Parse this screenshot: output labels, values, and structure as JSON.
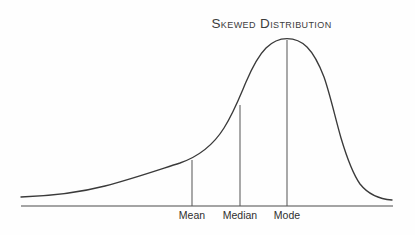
{
  "chart_data": {
    "type": "line",
    "title": "Skewed Distribution",
    "subtitle": "",
    "xlabel": "",
    "ylabel": "",
    "grid": false,
    "legend": false,
    "skew": "right-skewed (positive skew)",
    "annotations": [
      {
        "label": "Mean",
        "x_px": 192,
        "curve_top_px": 160,
        "order": 1
      },
      {
        "label": "Median",
        "x_px": 240,
        "curve_top_px": 105,
        "order": 2
      },
      {
        "label": "Mode",
        "x_px": 287,
        "curve_top_px": 40,
        "order": 3
      }
    ],
    "axis": {
      "baseline_y_px": 206,
      "x_start_px": 21,
      "x_end_px": 393,
      "ticks": [
        "Mean",
        "Median",
        "Mode"
      ]
    },
    "curve_points": [
      {
        "x": 21,
        "y": 197
      },
      {
        "x": 60,
        "y": 195
      },
      {
        "x": 95,
        "y": 189
      },
      {
        "x": 130,
        "y": 180
      },
      {
        "x": 160,
        "y": 170
      },
      {
        "x": 192,
        "y": 160
      },
      {
        "x": 215,
        "y": 140
      },
      {
        "x": 232,
        "y": 118
      },
      {
        "x": 240,
        "y": 105
      },
      {
        "x": 250,
        "y": 82
      },
      {
        "x": 258,
        "y": 62
      },
      {
        "x": 266,
        "y": 49
      },
      {
        "x": 276,
        "y": 41
      },
      {
        "x": 287,
        "y": 39
      },
      {
        "x": 300,
        "y": 41
      },
      {
        "x": 310,
        "y": 48
      },
      {
        "x": 320,
        "y": 62
      },
      {
        "x": 330,
        "y": 88
      },
      {
        "x": 342,
        "y": 125
      },
      {
        "x": 352,
        "y": 155
      },
      {
        "x": 362,
        "y": 176
      },
      {
        "x": 374,
        "y": 192
      },
      {
        "x": 385,
        "y": 198
      },
      {
        "x": 392,
        "y": 200
      }
    ],
    "ylim": [
      0,
      1
    ]
  },
  "colors": {
    "background": "#fefefe",
    "curve": "#3a3a3a",
    "axis": "#4a4a4a",
    "marker_line": "#5a5a5a",
    "title_text": "#3c3c3c",
    "tick_text": "#2f2f2f"
  }
}
